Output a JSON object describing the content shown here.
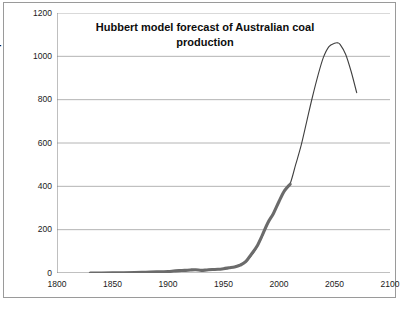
{
  "chart_data": {
    "type": "line",
    "title": "Hubbert model forecast of Australian coal production",
    "title_line1": "Hubbert model forecast of Australian coal",
    "title_line2": "production",
    "xlabel": "",
    "ylabel": "Coal production (Mt/year)",
    "xlim": [
      1800,
      2100
    ],
    "ylim": [
      0,
      1200
    ],
    "xticks": [
      1800,
      1850,
      1900,
      1950,
      2000,
      2050,
      2100
    ],
    "yticks": [
      0,
      200,
      400,
      600,
      800,
      1000,
      1200
    ],
    "grid": "horizontal",
    "legend": "none",
    "colors": {
      "historical_line": "#6b6b6b",
      "model_line": "#3f3f3f",
      "gridline": "#b4b4b4",
      "axis": "#808080",
      "border": "#9a9a9a",
      "text": "#0d0d0d"
    },
    "series": [
      {
        "name": "Historical production (thick grey)",
        "style": "thick-grey-line",
        "x": [
          1830,
          1840,
          1850,
          1860,
          1870,
          1880,
          1890,
          1900,
          1905,
          1910,
          1915,
          1920,
          1925,
          1930,
          1935,
          1940,
          1945,
          1950,
          1955,
          1960,
          1965,
          1970,
          1975,
          1980,
          1985,
          1990,
          1995,
          2000,
          2005,
          2010
        ],
        "values": [
          0,
          0.2,
          0.5,
          1,
          2,
          3.5,
          5,
          7,
          9,
          11,
          12,
          14,
          15,
          12,
          14,
          16,
          17,
          20,
          24,
          28,
          36,
          52,
          86,
          122,
          175,
          232,
          275,
          330,
          380,
          410
        ]
      },
      {
        "name": "Hubbert model forecast (thin curve)",
        "style": "thin-dark-line",
        "x": [
          1830,
          1870,
          1900,
          1920,
          1940,
          1950,
          1960,
          1970,
          1975,
          1980,
          1985,
          1990,
          1995,
          2000,
          2005,
          2010,
          2015,
          2020,
          2025,
          2030,
          2035,
          2040,
          2045,
          2050,
          2053,
          2055,
          2060,
          2065,
          2070
        ],
        "values": [
          0,
          2,
          6,
          12,
          17,
          21,
          30,
          52,
          80,
          118,
          170,
          230,
          278,
          330,
          378,
          412,
          500,
          590,
          700,
          810,
          910,
          995,
          1045,
          1060,
          1062,
          1055,
          1010,
          930,
          832
        ]
      }
    ],
    "annotations": {
      "peak_year": 2053,
      "peak_value": 1060,
      "historical_end_year": 2010,
      "historical_end_value": 410,
      "curve_end_year": 2070,
      "curve_end_value": 832
    }
  }
}
